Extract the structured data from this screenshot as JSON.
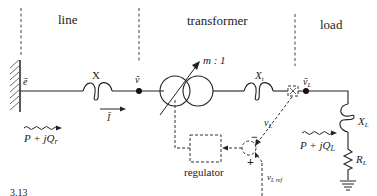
{
  "sections": {
    "line": "line",
    "transformer": "transformer",
    "load": "load"
  },
  "labels": {
    "source_voltage": "ẽ",
    "line_reactance": "X",
    "bus_voltage": "ṽ",
    "current": "Ī",
    "turns_ratio": "m : 1",
    "transformer_reactance_main": "X",
    "transformer_reactance_sub": "t",
    "load_voltage_main": "ṽ",
    "load_voltage_sub": "L",
    "measured_voltage_main": "v",
    "measured_voltage_sub": "L",
    "reference_voltage_main": "v",
    "reference_voltage_sub": "L ref",
    "load_reactance_main": "X",
    "load_reactance_sub": "L",
    "load_resistance_main": "R",
    "load_resistance_sub": "L",
    "power_flow_source": "P + jQ",
    "power_flow_source_sub": "r",
    "power_flow_load": "P + jQ",
    "power_flow_load_sub": "L",
    "regulator": "regulator",
    "minus_sign": "−",
    "plus_sign": "+"
  },
  "caption_fragment": "3.13"
}
